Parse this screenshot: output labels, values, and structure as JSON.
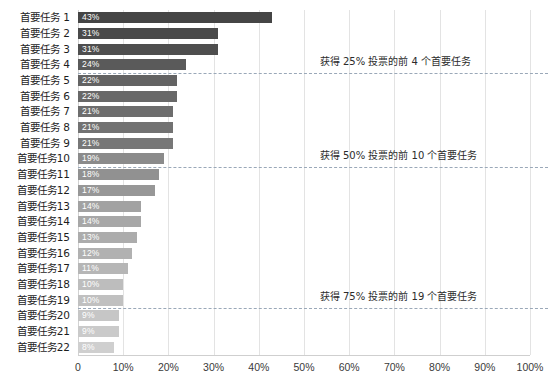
{
  "chart_data": {
    "type": "bar",
    "orientation": "horizontal",
    "title": "",
    "subtitle": "",
    "xlabel": "",
    "ylabel": "",
    "xlim": [
      0,
      100
    ],
    "grid": true,
    "legend_position": "none",
    "x_ticks": [
      "0",
      "10%",
      "20%",
      "30%",
      "40%",
      "50%",
      "60%",
      "70%",
      "80%",
      "90%",
      "100%"
    ],
    "x_tick_values": [
      0,
      10,
      20,
      30,
      40,
      50,
      60,
      70,
      80,
      90,
      100
    ],
    "categories": [
      "首要任务 1",
      "首要任务 2",
      "首要任务 3",
      "首要任务 4",
      "首要任务 5",
      "首要任务 6",
      "首要任务 7",
      "首要任务 8",
      "首要任务 9",
      "首要任务10",
      "首要任务11",
      "首要任务12",
      "首要任务13",
      "首要任务14",
      "首要任务15",
      "首要任务16",
      "首要任务17",
      "首要任务18",
      "首要任务19",
      "首要任务20",
      "首要任务21",
      "首要任务22"
    ],
    "values": [
      43,
      31,
      31,
      24,
      22,
      22,
      21,
      21,
      21,
      19,
      18,
      17,
      14,
      14,
      13,
      12,
      11,
      10,
      10,
      9,
      9,
      8
    ],
    "data_labels": [
      "43%",
      "31%",
      "31%",
      "24%",
      "22%",
      "22%",
      "21%",
      "21%",
      "21%",
      "19%",
      "18%",
      "17%",
      "14%",
      "14%",
      "13%",
      "12%",
      "11%",
      "10%",
      "10%",
      "9%",
      "9%",
      "8%"
    ],
    "bar_colors": [
      "#454545",
      "#4a4a4a",
      "#4e4e4e",
      "#5a5a5a",
      "#636363",
      "#686868",
      "#6d6d6d",
      "#727272",
      "#777777",
      "#8b8b8b",
      "#919191",
      "#979797",
      "#a2a2a2",
      "#a7a7a7",
      "#acacac",
      "#b1b1b1",
      "#b6b6b6",
      "#bdbdbd",
      "#c0c0c0",
      "#c6c6c6",
      "#cacaca",
      "#cfcfcf"
    ],
    "annotations": [
      {
        "text": "获得 25% 投票的前 4 个首要任务",
        "after_category_index": 3
      },
      {
        "text": "获得 50% 投票的前 10 个首要任务",
        "after_category_index": 9
      },
      {
        "text": "获得 75% 投票的前 19 个首要任务",
        "after_category_index": 18
      }
    ],
    "threshold_color": "#9aa8b8"
  },
  "colors": {
    "background": "#ffffff",
    "gridline": "#e3e3e3",
    "axis_text": "#3a3a3a",
    "category_text": "#1d1d1d",
    "data_label_text": "#ffffff",
    "annotation_text": "#2b2b2b"
  }
}
